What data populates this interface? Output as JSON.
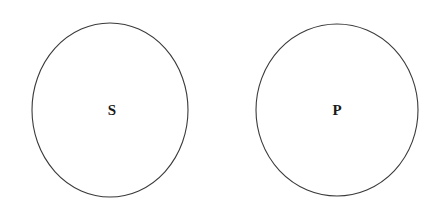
{
  "figure": {
    "type": "two-circle-set-diagram",
    "background_color": "#ffffff",
    "stroke_color": "#3a3a3a",
    "label_color": "#1a1a1a",
    "width": 447,
    "height": 214
  },
  "sets": [
    {
      "id": "set-s",
      "label": "S",
      "label_x": 112,
      "label_y": 112,
      "center_x": 110,
      "center_y": 110,
      "radius_x": 78,
      "radius_y": 87
    },
    {
      "id": "set-p",
      "label": "P",
      "label_x": 337,
      "label_y": 112,
      "center_x": 337,
      "center_y": 110,
      "radius_x": 81,
      "radius_y": 86
    }
  ]
}
